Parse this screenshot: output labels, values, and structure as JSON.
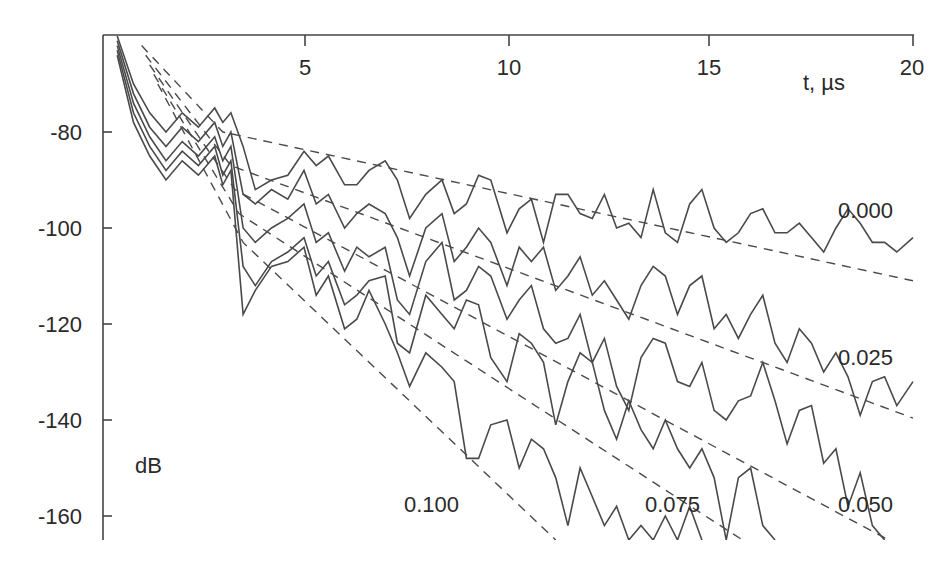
{
  "chart_data": {
    "type": "line",
    "title": "",
    "xlabel": "t, µs",
    "ylabel": "dB",
    "xlim": [
      0,
      20
    ],
    "ylim": [
      -165,
      -60
    ],
    "x_axis_position": "top",
    "grid": false,
    "x_ticks": [
      5,
      10,
      15,
      20
    ],
    "x_tick_labels": [
      "5",
      "10",
      "15",
      "20"
    ],
    "y_ticks": [
      -80,
      -100,
      -120,
      -140,
      -160
    ],
    "y_tick_labels": [
      "-80",
      "-100",
      "-120",
      "-140",
      "-160"
    ],
    "legend": "inline labels",
    "series": [
      {
        "name": "0.000",
        "label_pos": [
          18.1,
          -101
        ],
        "x": [
          0.4,
          0.8,
          1.2,
          1.6,
          2.0,
          2.4,
          2.8,
          3.0,
          3.2,
          3.5,
          3.8,
          4.2,
          4.6,
          5.0,
          5.3,
          5.6,
          6.0,
          6.3,
          6.6,
          7.0,
          7.3,
          7.6,
          8.0,
          8.4,
          8.7,
          9.0,
          9.3,
          9.6,
          10.0,
          10.3,
          10.6,
          10.9,
          11.2,
          11.5,
          11.8,
          12.1,
          12.4,
          12.7,
          13.0,
          13.3,
          13.6,
          13.9,
          14.2,
          14.5,
          14.8,
          15.1,
          15.4,
          15.7,
          16.0,
          16.3,
          16.6,
          16.9,
          17.2,
          17.5,
          17.8,
          18.1,
          18.4,
          18.7,
          19.0,
          19.3,
          19.6,
          20.0
        ],
        "y": [
          -60,
          -70,
          -76,
          -80,
          -76,
          -79,
          -75,
          -78,
          -76,
          -83,
          -92,
          -90,
          -89,
          -84,
          -87,
          -85,
          -91,
          -91,
          -88,
          -86,
          -90,
          -98,
          -93,
          -90,
          -97,
          -95,
          -89,
          -90,
          -101,
          -96,
          -94,
          -103,
          -93,
          -93,
          -97,
          -98,
          -93,
          -100,
          -99,
          -102,
          -92,
          -101,
          -103,
          -95,
          -92,
          -100,
          -103,
          -101,
          -97,
          -96,
          -101,
          -101,
          -99,
          -102,
          -105,
          -100,
          -96,
          -99,
          -103,
          -103,
          -105,
          -102
        ]
      },
      {
        "name": "0.025",
        "label_pos": [
          18.1,
          -129
        ],
        "x": [
          0.4,
          0.8,
          1.2,
          1.6,
          2.0,
          2.4,
          2.8,
          3.0,
          3.2,
          3.5,
          3.8,
          4.2,
          4.6,
          5.0,
          5.3,
          5.6,
          6.0,
          6.3,
          6.6,
          7.0,
          7.3,
          7.6,
          8.0,
          8.4,
          8.7,
          9.0,
          9.3,
          9.6,
          10.0,
          10.3,
          10.6,
          10.9,
          11.2,
          11.5,
          11.8,
          12.1,
          12.4,
          12.7,
          13.0,
          13.3,
          13.6,
          13.9,
          14.2,
          14.5,
          14.8,
          15.1,
          15.4,
          15.7,
          16.0,
          16.3,
          16.6,
          16.9,
          17.2,
          17.5,
          17.8,
          18.1,
          18.4,
          18.7,
          19.0,
          19.3,
          19.6,
          20.0
        ],
        "y": [
          -61,
          -72,
          -79,
          -83,
          -79,
          -82,
          -78,
          -83,
          -80,
          -93,
          -95,
          -92,
          -94,
          -88,
          -95,
          -93,
          -100,
          -97,
          -95,
          -97,
          -102,
          -110,
          -100,
          -97,
          -107,
          -104,
          -100,
          -103,
          -112,
          -104,
          -107,
          -104,
          -113,
          -110,
          -106,
          -114,
          -111,
          -115,
          -119,
          -112,
          -108,
          -110,
          -118,
          -112,
          -110,
          -121,
          -118,
          -123,
          -118,
          -114,
          -124,
          -128,
          -121,
          -124,
          -130,
          -126,
          -131,
          -139,
          -132,
          -131,
          -137,
          -132
        ]
      },
      {
        "name": "0.050",
        "label_pos": [
          18.1,
          -157
        ],
        "x": [
          0.4,
          0.8,
          1.2,
          1.6,
          2.0,
          2.4,
          2.8,
          3.0,
          3.2,
          3.5,
          3.8,
          4.2,
          4.6,
          5.0,
          5.3,
          5.6,
          6.0,
          6.3,
          6.6,
          7.0,
          7.3,
          7.6,
          8.0,
          8.4,
          8.7,
          9.0,
          9.3,
          9.6,
          10.0,
          10.3,
          10.6,
          10.9,
          11.2,
          11.5,
          11.8,
          12.1,
          12.4,
          12.7,
          13.0,
          13.3,
          13.6,
          13.9,
          14.2,
          14.5,
          14.8,
          15.1,
          15.4,
          15.7,
          16.0,
          16.3,
          16.6,
          16.9,
          17.2,
          17.5,
          17.8,
          18.1,
          18.4,
          18.7,
          19.0,
          19.3
        ],
        "y": [
          -62,
          -74,
          -81,
          -86,
          -82,
          -85,
          -81,
          -86,
          -83,
          -100,
          -103,
          -100,
          -98,
          -95,
          -103,
          -101,
          -109,
          -104,
          -106,
          -104,
          -115,
          -118,
          -107,
          -103,
          -115,
          -113,
          -108,
          -110,
          -119,
          -115,
          -112,
          -121,
          -124,
          -123,
          -118,
          -128,
          -123,
          -133,
          -138,
          -127,
          -123,
          -124,
          -132,
          -133,
          -128,
          -138,
          -140,
          -136,
          -135,
          -128,
          -136,
          -145,
          -138,
          -137,
          -149,
          -146,
          -158,
          -151,
          -162,
          -165
        ]
      },
      {
        "name": "0.075",
        "label_pos": [
          13.0,
          -157
        ],
        "x": [
          0.4,
          0.8,
          1.2,
          1.6,
          2.0,
          2.4,
          2.8,
          3.0,
          3.2,
          3.5,
          3.8,
          4.2,
          4.6,
          5.0,
          5.3,
          5.6,
          6.0,
          6.3,
          6.6,
          7.0,
          7.3,
          7.6,
          8.0,
          8.4,
          8.7,
          9.0,
          9.3,
          9.6,
          10.0,
          10.3,
          10.6,
          10.9,
          11.2,
          11.5,
          11.8,
          12.1,
          12.4,
          12.7,
          13.0,
          13.3,
          13.6,
          13.9,
          14.2,
          14.5,
          14.8,
          15.1,
          15.4,
          15.7,
          16.0,
          16.3,
          16.6
        ],
        "y": [
          -63,
          -76,
          -83,
          -88,
          -84,
          -87,
          -83,
          -89,
          -86,
          -108,
          -112,
          -107,
          -105,
          -102,
          -110,
          -107,
          -116,
          -114,
          -111,
          -110,
          -124,
          -126,
          -114,
          -118,
          -121,
          -115,
          -116,
          -127,
          -132,
          -122,
          -124,
          -128,
          -141,
          -132,
          -126,
          -128,
          -138,
          -144,
          -136,
          -142,
          -146,
          -140,
          -146,
          -150,
          -146,
          -152,
          -165,
          -152,
          -150,
          -162,
          -165
        ]
      },
      {
        "name": "0.100",
        "label_pos": [
          7.4,
          -157
        ],
        "x": [
          0.4,
          0.8,
          1.2,
          1.6,
          2.0,
          2.4,
          2.8,
          3.0,
          3.2,
          3.5,
          3.8,
          4.2,
          4.6,
          5.0,
          5.3,
          5.6,
          6.0,
          6.3,
          6.6,
          7.0,
          7.3,
          7.6,
          8.0,
          8.4,
          8.7,
          9.0,
          9.3,
          9.6,
          10.0,
          10.3,
          10.6,
          10.9,
          11.2,
          11.5,
          11.8,
          12.1,
          12.4,
          12.7,
          13.0,
          13.3,
          13.6,
          13.9,
          14.2,
          14.5,
          14.8
        ],
        "y": [
          -64,
          -78,
          -85,
          -90,
          -86,
          -89,
          -85,
          -91,
          -88,
          -118,
          -113,
          -108,
          -107,
          -104,
          -114,
          -110,
          -121,
          -119,
          -113,
          -120,
          -126,
          -133,
          -126,
          -129,
          -132,
          -148,
          -148,
          -141,
          -140,
          -150,
          -144,
          -146,
          -152,
          -162,
          -150,
          -156,
          -162,
          -158,
          -165,
          -162,
          -165,
          -160,
          -165,
          -158,
          -165
        ]
      }
    ],
    "trend_lines": [
      {
        "name": "0.000",
        "x": [
          1.0,
          3.0,
          20.0
        ],
        "y": [
          -62,
          -80,
          -111
        ]
      },
      {
        "name": "0.025",
        "x": [
          1.1,
          3.2,
          20.0
        ],
        "y": [
          -64,
          -87,
          -139.6
        ]
      },
      {
        "name": "0.050",
        "x": [
          1.2,
          3.3,
          19.4
        ],
        "y": [
          -66,
          -92,
          -165
        ]
      },
      {
        "name": "0.075",
        "x": [
          1.3,
          3.4,
          15.8
        ],
        "y": [
          -68,
          -97,
          -165
        ]
      },
      {
        "name": "0.100",
        "x": [
          1.4,
          3.5,
          11.2
        ],
        "y": [
          -70,
          -103,
          -165
        ]
      }
    ]
  }
}
